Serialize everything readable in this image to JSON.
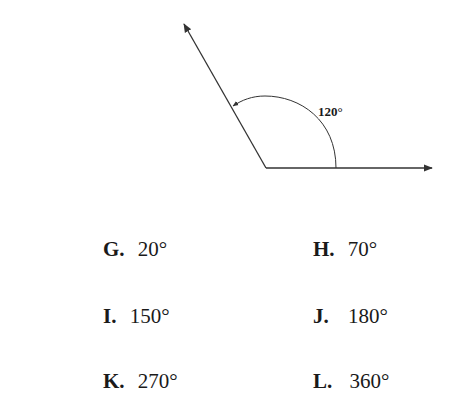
{
  "diagram": {
    "angle_label": "120°",
    "angle_degrees": 120,
    "line_color": "#333333"
  },
  "choices": [
    {
      "letter": "G.",
      "value": "20°"
    },
    {
      "letter": "H.",
      "value": "70°"
    },
    {
      "letter": "I.",
      "value": "150°"
    },
    {
      "letter": "J.",
      "value": "180°"
    },
    {
      "letter": "K.",
      "value": "270°"
    },
    {
      "letter": "L.",
      "value": "360°"
    }
  ]
}
